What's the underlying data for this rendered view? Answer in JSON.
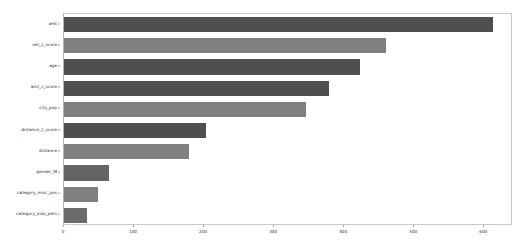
{
  "chart_data": {
    "type": "bar",
    "orientation": "horizontal",
    "title": "",
    "xlabel": "",
    "ylabel": "feature_name",
    "categories": [
      "amt",
      "net_z_score",
      "age",
      "amt_z_score",
      "city_pop",
      "distance_z_score",
      "distance",
      "gender_M",
      "category_misc_pos",
      "category_kids_pets"
    ],
    "values": [
      613,
      460,
      423,
      379,
      346,
      203,
      179,
      64,
      49,
      33
    ],
    "xlim": [
      0,
      641
    ],
    "xticks": [
      0,
      100,
      200,
      300,
      400,
      500,
      600
    ],
    "xticklabels": [
      "0",
      "100",
      "200",
      "300",
      "400",
      "500",
      "600"
    ],
    "grid": false,
    "legend": null,
    "bar_colors": [
      "#4f4f4f",
      "#808080",
      "#4f4f4f",
      "#4f4f4f",
      "#808080",
      "#4f4f4f",
      "#808080",
      "#636363",
      "#808080",
      "#6b6b6b"
    ]
  },
  "axes": {
    "y_axis_title": "feature_name",
    "x_tick_labels": [
      "0",
      "100",
      "200",
      "300",
      "400",
      "500",
      "600"
    ],
    "y_tick_labels": [
      "amt",
      "net_z_score",
      "age",
      "amt_z_score",
      "city_pop",
      "distance_z_score",
      "distance",
      "gender_M",
      "category_misc_pos",
      "category_kids_pets"
    ]
  },
  "colors": {
    "background": "#ffffff",
    "bar_dark": "#4f4f4f",
    "bar_light": "#808080",
    "axis_line": "#c9c9c9",
    "text": "#2b2b2b"
  }
}
